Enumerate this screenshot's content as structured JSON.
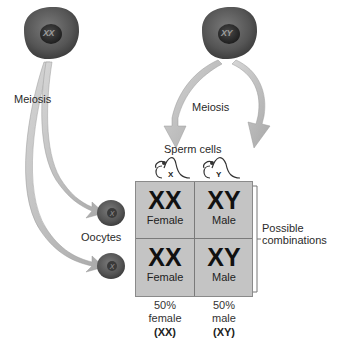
{
  "parents": {
    "female": {
      "genotype": "XX"
    },
    "male": {
      "genotype": "XY"
    }
  },
  "labels": {
    "meiosis_female": "Meiosis",
    "meiosis_male": "Meiosis",
    "sperm_cells": "Sperm cells",
    "oocytes": "Oocytes",
    "possible_combinations_line1": "Possible",
    "possible_combinations_line2": "combinations"
  },
  "gametes": {
    "sperm": [
      {
        "chromosome": "X"
      },
      {
        "chromosome": "Y"
      }
    ],
    "oocytes": [
      {
        "chromosome": "X"
      },
      {
        "chromosome": "X"
      }
    ]
  },
  "punnett": {
    "cells": [
      {
        "genotype": "XX",
        "sex": "Female"
      },
      {
        "genotype": "XY",
        "sex": "Male"
      },
      {
        "genotype": "XX",
        "sex": "Female"
      },
      {
        "genotype": "XY",
        "sex": "Male"
      }
    ]
  },
  "summary": [
    {
      "percent": "50%",
      "sex": "female",
      "genotype": "(XX)"
    },
    {
      "percent": "50%",
      "sex": "male",
      "genotype": "(XY)"
    }
  ],
  "colors": {
    "cell_body": "#5a5a5a",
    "cell_nucleus": "#2a2a2a",
    "arrow": "#bdbdbd",
    "grid_fill": "#c4c4c4",
    "grid_line": "#7a7a7a"
  }
}
